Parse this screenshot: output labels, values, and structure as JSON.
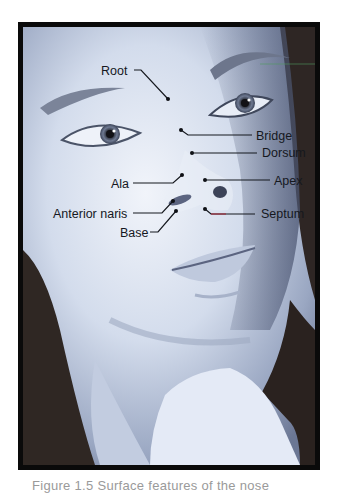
{
  "figure": {
    "labels": {
      "root": "Root",
      "bridge": "Bridge",
      "dorsum": "Dorsum",
      "ala": "Ala",
      "apex": "Apex",
      "anterior_naris": "Anterior naris",
      "septum": "Septum",
      "base": "Base"
    },
    "colors": {
      "frame": "#0a0a0a",
      "skin_light": "#e9eef7",
      "skin_mid": "#b7c3d9",
      "skin_shadow": "#7f8ba6",
      "hair": "#2a2220",
      "label_text": "#15181e",
      "septum_accent": "#a03040"
    }
  },
  "caption": {
    "text": "Figure 1.5  Surface features of the nose"
  }
}
